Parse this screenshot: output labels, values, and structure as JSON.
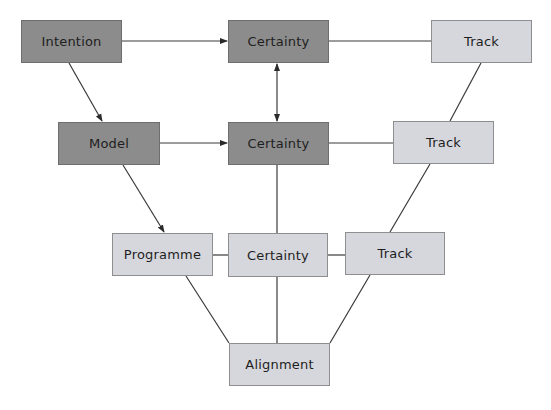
{
  "diagram": {
    "colors": {
      "dark_fill": "#8c8c8c",
      "light_fill": "#d6d7dd",
      "line": "#3a3a3a"
    },
    "nodes": {
      "intention": {
        "label": "Intention",
        "style": "dark"
      },
      "certainty_top": {
        "label": "Certainty",
        "style": "dark"
      },
      "track_top": {
        "label": "Track",
        "style": "light"
      },
      "model": {
        "label": "Model",
        "style": "dark"
      },
      "certainty_mid": {
        "label": "Certainty",
        "style": "dark"
      },
      "track_mid": {
        "label": "Track",
        "style": "light"
      },
      "programme": {
        "label": "Programme",
        "style": "light"
      },
      "certainty_bottom": {
        "label": "Certainty",
        "style": "light"
      },
      "track_bottom": {
        "label": "Track",
        "style": "light"
      },
      "alignment": {
        "label": "Alignment",
        "style": "light"
      }
    },
    "edges": [
      {
        "from": "intention",
        "to": "certainty_top",
        "type": "arrow"
      },
      {
        "from": "certainty_top",
        "to": "track_top",
        "type": "line"
      },
      {
        "from": "intention",
        "to": "model",
        "type": "arrow"
      },
      {
        "from": "certainty_top",
        "to": "certainty_mid",
        "type": "double-arrow"
      },
      {
        "from": "track_top",
        "to": "track_mid",
        "type": "line"
      },
      {
        "from": "model",
        "to": "certainty_mid",
        "type": "arrow"
      },
      {
        "from": "certainty_mid",
        "to": "track_mid",
        "type": "line"
      },
      {
        "from": "model",
        "to": "programme",
        "type": "arrow"
      },
      {
        "from": "certainty_mid",
        "to": "certainty_bottom",
        "type": "line"
      },
      {
        "from": "track_mid",
        "to": "track_bottom",
        "type": "line"
      },
      {
        "from": "programme",
        "to": "certainty_bottom",
        "type": "line"
      },
      {
        "from": "certainty_bottom",
        "to": "track_bottom",
        "type": "line"
      },
      {
        "from": "programme",
        "to": "alignment",
        "type": "line"
      },
      {
        "from": "certainty_bottom",
        "to": "alignment",
        "type": "line"
      },
      {
        "from": "track_bottom",
        "to": "alignment",
        "type": "line"
      }
    ]
  }
}
